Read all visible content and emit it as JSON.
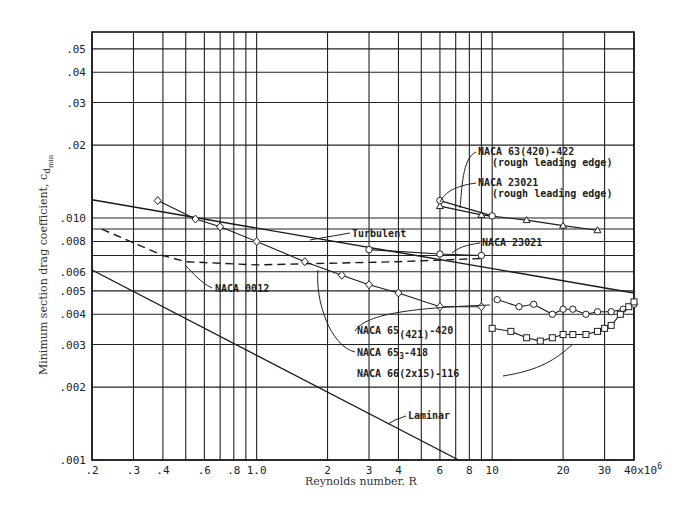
{
  "chart_data": {
    "type": "line",
    "title": "",
    "xlabel": "Reynolds number, R",
    "ylabel": "Minimum section drag coefficient, c_d_min",
    "xscale": "log",
    "yscale": "log",
    "xlim": [
      0.2,
      40
    ],
    "ylim": [
      0.001,
      0.06
    ],
    "x_unit_multiplier": "x10^6",
    "grid": true,
    "x_ticks": [
      ".2",
      ".3",
      ".4",
      ".6",
      ".8",
      "1.0",
      "2",
      "3",
      "4",
      "6",
      "8",
      "10",
      "20",
      "30",
      "40x10^6"
    ],
    "x_tick_values": [
      0.2,
      0.3,
      0.4,
      0.6,
      0.8,
      1.0,
      2,
      3,
      4,
      6,
      8,
      10,
      20,
      30,
      40
    ],
    "x_grid_values": [
      0.2,
      0.3,
      0.4,
      0.5,
      0.6,
      0.7,
      0.8,
      0.9,
      1.0,
      2,
      3,
      4,
      5,
      6,
      7,
      8,
      9,
      10,
      20,
      30,
      40
    ],
    "y_ticks": [
      ".001",
      ".002",
      ".003",
      ".004",
      ".005",
      ".006",
      ".008",
      ".010",
      ".02",
      ".03",
      ".04",
      ".05"
    ],
    "y_tick_values": [
      0.001,
      0.002,
      0.003,
      0.004,
      0.005,
      0.006,
      0.008,
      0.01,
      0.02,
      0.03,
      0.04,
      0.05
    ],
    "y_grid_values": [
      0.001,
      0.002,
      0.003,
      0.004,
      0.005,
      0.006,
      0.007,
      0.008,
      0.009,
      0.01,
      0.02,
      0.03,
      0.04,
      0.05
    ],
    "series": [
      {
        "name": "Turbulent",
        "style": "solid",
        "marker": "none",
        "x": [
          0.2,
          40
        ],
        "y": [
          0.0119,
          0.0049
        ]
      },
      {
        "name": "Laminar",
        "style": "solid",
        "marker": "none",
        "x": [
          0.2,
          7.2
        ],
        "y": [
          0.0061,
          0.001
        ]
      },
      {
        "name": "NACA 0012",
        "style": "dashed",
        "marker": "none",
        "x": [
          0.22,
          0.3,
          0.4,
          0.5,
          1.0,
          2.0,
          4.0,
          9.0
        ],
        "y": [
          0.009,
          0.0079,
          0.007,
          0.0066,
          0.0064,
          0.0065,
          0.0066,
          0.0068
        ]
      },
      {
        "name": "NACA 65₃-418",
        "style": "solid",
        "marker": "diamond",
        "x": [
          0.38,
          0.55,
          0.7,
          1.0,
          1.6,
          2.3,
          3.0,
          4.0,
          6.0,
          9.0
        ],
        "y": [
          0.0118,
          0.0099,
          0.0092,
          0.008,
          0.0066,
          0.0058,
          0.0053,
          0.0049,
          0.0043,
          0.0043
        ]
      },
      {
        "name": "NACA 23021",
        "style": "solid",
        "marker": "circle",
        "x": [
          3.0,
          6.0,
          9.0
        ],
        "y": [
          0.0074,
          0.0071,
          0.007
        ]
      },
      {
        "name": "NACA 63(420)-422 (rough leading edge)",
        "style": "solid",
        "marker": "triangle",
        "x": [
          6.0,
          9.0,
          14.0,
          20.0,
          28.0
        ],
        "y": [
          0.0112,
          0.0103,
          0.0098,
          0.0093,
          0.0089
        ]
      },
      {
        "name": "NACA 23021 (rough leading edge)",
        "style": "solid",
        "marker": "circle",
        "x": [
          6.0,
          10.0
        ],
        "y": [
          0.0118,
          0.0102
        ]
      },
      {
        "name": "NACA 65(421)-420",
        "style": "solid",
        "marker": "circle",
        "x": [
          10.5,
          13,
          15,
          18,
          20,
          22,
          25,
          28,
          32,
          36,
          40
        ],
        "y": [
          0.0046,
          0.0043,
          0.0044,
          0.004,
          0.0042,
          0.0042,
          0.004,
          0.0041,
          0.0041,
          0.0042,
          0.0044
        ]
      },
      {
        "name": "NACA 66(2x15)-116",
        "style": "solid",
        "marker": "square",
        "x": [
          10,
          12,
          14,
          16,
          18,
          20,
          22,
          25,
          28,
          30,
          32,
          35,
          38,
          40
        ],
        "y": [
          0.0035,
          0.0034,
          0.0032,
          0.0031,
          0.0032,
          0.0033,
          0.0033,
          0.0033,
          0.0034,
          0.0035,
          0.0036,
          0.004,
          0.0043,
          0.0045
        ]
      }
    ],
    "annotations": [
      "NACA 63(420)-422 (rough leading edge)",
      "NACA 23021 (rough leading edge)",
      "Turbulent",
      "NACA 23021",
      "NACA 0012",
      "NACA 65(421)-420",
      "NACA 65₃-418",
      "NACA 66(2x15)-116",
      "Laminar"
    ]
  },
  "labels": {
    "xlabel": "Reynolds number. R",
    "ylabel": "Minimum section drag coefficient,  c",
    "ylabel_sub": "d",
    "ylabel_subsub": "min",
    "ann_63": "NACA 63(420)-422",
    "ann_63_sub": "(rough leading edge)",
    "ann_23r": "NACA 23021",
    "ann_23r_sub": "(rough leading edge)",
    "ann_turb": "Turbulent",
    "ann_23": "NACA 23021",
    "ann_0012": "NACA 0012",
    "ann_65_421_a": "NACA 65",
    "ann_65_421_b": "(421)",
    "ann_65_421_c": "-420",
    "ann_653_a": "NACA 65",
    "ann_653_b": "3",
    "ann_653_c": "-418",
    "ann_66": "NACA 66(2x15)-116",
    "ann_lam": "Laminar",
    "x_ticks": [
      ".2",
      ".3",
      ".4",
      ".6",
      ".8",
      "1.0",
      "2",
      "3",
      "4",
      "6",
      "8",
      "10",
      "20",
      "30",
      "40x10"
    ],
    "x_last_exp": "6",
    "y_ticks": [
      ".001",
      ".002",
      ".003",
      ".004",
      ".005",
      ".006",
      ".008",
      ".010",
      ".02",
      ".03",
      ".04",
      ".05"
    ]
  }
}
